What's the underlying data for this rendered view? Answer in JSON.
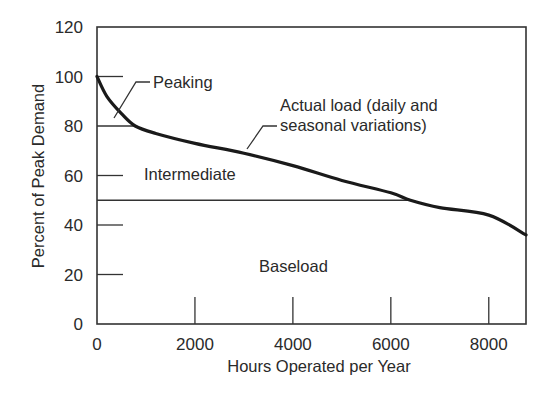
{
  "chart_data": {
    "type": "line",
    "title": "",
    "xlabel": "Hours Operated per Year",
    "ylabel": "Percent of Peak Demand",
    "xlim": [
      0,
      8760
    ],
    "ylim": [
      0,
      120
    ],
    "x_ticks": [
      0,
      2000,
      4000,
      6000,
      8000
    ],
    "y_ticks": [
      0,
      20,
      40,
      60,
      80,
      100,
      120
    ],
    "x_tick_labels": [
      "0",
      "2000",
      "4000",
      "6000",
      "8000"
    ],
    "y_tick_labels": [
      "0",
      "20",
      "40",
      "60",
      "80",
      "100",
      "120"
    ],
    "grid": false,
    "legend": null,
    "series": [
      {
        "name": "Actual load (daily and seasonal variations)",
        "x": [
          0,
          200,
          500,
          780,
          1200,
          2000,
          3000,
          4000,
          5000,
          6000,
          6400,
          7000,
          8000,
          8760
        ],
        "y": [
          100,
          92,
          85,
          80,
          77,
          73,
          69,
          64,
          58,
          53,
          50,
          47,
          44,
          36
        ]
      }
    ],
    "bands": [
      {
        "name": "Peaking",
        "from": 80,
        "to": 100
      },
      {
        "name": "Intermediate",
        "from": 50,
        "to": 80
      },
      {
        "name": "Baseload",
        "from": 0,
        "to": 50
      }
    ],
    "annotations": [
      {
        "text": "Peaking",
        "target": "region between 80 and 100"
      },
      {
        "text": "Actual load (daily and seasonal variations)",
        "target": "load duration curve"
      },
      {
        "text": "Intermediate",
        "position": "between 50 and 80"
      },
      {
        "text": "Baseload",
        "position": "below 50"
      }
    ],
    "reference_lines": [
      {
        "y": 80,
        "x_to": 780
      },
      {
        "y": 50,
        "x_to": 6400
      }
    ]
  },
  "labels": {
    "xlabel": "Hours Operated per Year",
    "ylabel": "Percent of Peak Demand",
    "peaking": "Peaking",
    "actual_load_line1": "Actual load (daily and",
    "actual_load_line2": "seasonal variations)",
    "intermediate": "Intermediate",
    "baseload": "Baseload"
  }
}
